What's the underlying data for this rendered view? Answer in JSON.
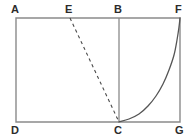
{
  "figure": {
    "kind": "geometry-diagram",
    "background_color": "#ffffff",
    "stroke_color": "#8a8a8a",
    "curve_color": "#555555",
    "dashed_color": "#4a4a4a",
    "label_color": "#2b2b2b",
    "width": 193,
    "height": 139
  },
  "labels": {
    "a": "A",
    "b": "B",
    "c": "C",
    "d": "D",
    "e": "E",
    "f": "F",
    "g": "G"
  },
  "chart_data": {
    "type": "line",
    "title": "",
    "xlabel": "",
    "ylabel": "",
    "grid": false,
    "legend": "none",
    "xlim": [
      16,
      180
    ],
    "ylim": [
      18,
      122
    ],
    "annotations": [
      {
        "name": "A",
        "x": 16,
        "y": 18,
        "note": "top-left rectangle corner"
      },
      {
        "name": "E",
        "x": 70,
        "y": 18,
        "note": "point on top edge"
      },
      {
        "name": "B",
        "x": 119,
        "y": 18,
        "note": "top of vertical divider"
      },
      {
        "name": "F",
        "x": 180,
        "y": 18,
        "note": "top-right rectangle corner"
      },
      {
        "name": "D",
        "x": 16,
        "y": 122,
        "note": "bottom-left rectangle corner"
      },
      {
        "name": "C",
        "x": 119,
        "y": 122,
        "note": "foot of vertical divider"
      },
      {
        "name": "G",
        "x": 180,
        "y": 122,
        "note": "bottom-right rectangle corner"
      }
    ],
    "series": [
      {
        "name": "rectangle-ADGF",
        "style": "solid",
        "points": [
          {
            "x": 16,
            "y": 18
          },
          {
            "x": 180,
            "y": 18
          },
          {
            "x": 180,
            "y": 122
          },
          {
            "x": 16,
            "y": 122
          },
          {
            "x": 16,
            "y": 18
          }
        ]
      },
      {
        "name": "segment-BC",
        "style": "solid",
        "points": [
          {
            "x": 119,
            "y": 18
          },
          {
            "x": 119,
            "y": 122
          }
        ]
      },
      {
        "name": "segment-EC-dashed",
        "style": "dashed",
        "points": [
          {
            "x": 70,
            "y": 18
          },
          {
            "x": 119,
            "y": 122
          }
        ]
      },
      {
        "name": "curve-CF",
        "style": "solid",
        "curve": "exponential",
        "points": [
          {
            "x": 119,
            "y": 122
          },
          {
            "x": 129,
            "y": 119
          },
          {
            "x": 139,
            "y": 114
          },
          {
            "x": 148,
            "y": 106
          },
          {
            "x": 156,
            "y": 96
          },
          {
            "x": 163,
            "y": 84
          },
          {
            "x": 169,
            "y": 70
          },
          {
            "x": 174,
            "y": 55
          },
          {
            "x": 177,
            "y": 40
          },
          {
            "x": 179,
            "y": 27
          },
          {
            "x": 180,
            "y": 18
          }
        ]
      }
    ]
  },
  "label_positions": {
    "a": {
      "left": 11,
      "top": 4
    },
    "e": {
      "left": 65,
      "top": 4
    },
    "b": {
      "left": 114,
      "top": 4
    },
    "f": {
      "left": 175,
      "top": 4
    },
    "d": {
      "left": 11,
      "top": 125
    },
    "c": {
      "left": 114,
      "top": 125
    },
    "g": {
      "left": 175,
      "top": 125
    }
  }
}
